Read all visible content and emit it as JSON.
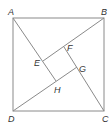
{
  "diagram": {
    "type": "geometry",
    "line_color": "#8a8a8a",
    "label_color": "#333333",
    "points": {
      "A": {
        "label": "A",
        "x": 13,
        "y": 18
      },
      "B": {
        "label": "B",
        "x": 104,
        "y": 18
      },
      "C": {
        "label": "C",
        "x": 104,
        "y": 111
      },
      "D": {
        "label": "D",
        "x": 13,
        "y": 111
      },
      "E": {
        "label": "E",
        "x": 43,
        "y": 61
      },
      "F": {
        "label": "F",
        "x": 64,
        "y": 47
      },
      "G": {
        "label": "G",
        "x": 77,
        "y": 67
      },
      "H": {
        "label": "H",
        "x": 56,
        "y": 81
      }
    },
    "segments": [
      "AB",
      "BC",
      "CD",
      "DA",
      "AH",
      "BE",
      "CF",
      "DG"
    ]
  }
}
